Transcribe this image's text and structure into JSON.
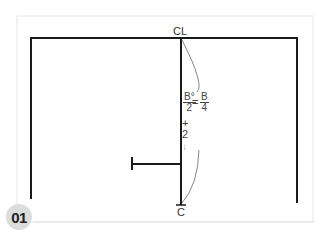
{
  "figure": {
    "badge": "01",
    "top_label": "CL",
    "bottom_label": "C",
    "formula": {
      "left_numerator": "B°",
      "left_denominator": "2",
      "equals": "=",
      "right_numerator": "B",
      "right_denominator": "4",
      "plus": "+",
      "addend": "2",
      "arrow": "↓"
    },
    "colors": {
      "line": "#1a1a1a",
      "frame": "#e6e6e6",
      "curve": "#888888",
      "badge_bg": "#dcdcdc"
    }
  }
}
